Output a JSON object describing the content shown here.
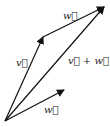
{
  "diagram": {
    "origin": [
      5,
      121
    ],
    "vectors": [
      {
        "id": "v",
        "label": "v⃗",
        "from": [
          5,
          121
        ],
        "to": [
          43,
          37
        ],
        "label_pos": [
          16,
          66
        ]
      },
      {
        "id": "w_top",
        "label": "w⃗",
        "from": [
          43,
          37
        ],
        "to": [
          104,
          7
        ],
        "label_pos": [
          63,
          19
        ]
      },
      {
        "id": "sum",
        "label": "v⃗ + w⃗",
        "from": [
          5,
          121
        ],
        "to": [
          104,
          7
        ],
        "label_pos": [
          68,
          64
        ]
      },
      {
        "id": "w_bottom",
        "label": "w⃗",
        "from": [
          5,
          121
        ],
        "to": [
          64,
          90
        ],
        "label_pos": [
          44,
          113
        ]
      }
    ],
    "colors": {
      "stroke": "#111111",
      "label": "#222222",
      "background": "#ffffff"
    }
  }
}
